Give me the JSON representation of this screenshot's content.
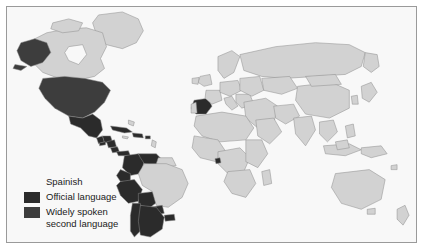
{
  "map": {
    "projection_note": "world map",
    "colors": {
      "ocean": "#f8f8f8",
      "land": "#d2d2d2",
      "border": "#8c8c8c",
      "official": "#2b2b2b",
      "second": "#3d3d3d",
      "frame": "#9a9a9a",
      "page_background": "#ffffff"
    },
    "regions_official": [
      "Spain",
      "Mexico",
      "Guatemala",
      "Honduras",
      "El Salvador",
      "Nicaragua",
      "Costa Rica",
      "Panama",
      "Cuba",
      "Dominican Republic",
      "Puerto Rico",
      "Colombia",
      "Venezuela",
      "Ecuador",
      "Peru",
      "Bolivia",
      "Chile",
      "Argentina",
      "Uruguay",
      "Paraguay",
      "Equatorial Guinea"
    ],
    "regions_second_language": [
      "United States",
      "Alaska"
    ],
    "regions_unshaded": [
      "Brazil",
      "Guyana",
      "Suriname",
      "French Guiana",
      "Canada",
      "Greenland",
      "Europe",
      "Africa",
      "Asia",
      "Australia",
      "New Zealand"
    ]
  },
  "legend": {
    "title": "Spainish",
    "items": [
      {
        "label": "Official language",
        "color": "#2b2b2b"
      },
      {
        "label": "Widely spoken\nsecond language",
        "color": "#3d3d3d"
      }
    ]
  }
}
